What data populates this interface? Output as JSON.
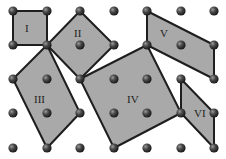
{
  "diagram": {
    "grid": {
      "columns": 7,
      "rows": 5,
      "col_x": [
        13,
        47,
        80,
        114,
        147,
        181,
        214
      ],
      "row_y": [
        11,
        45,
        79,
        113,
        148
      ]
    },
    "colors": {
      "fill": "#a9a9a9",
      "stroke": "#1e1e1e",
      "dot": "#3a3a3a",
      "background": "#ffffff"
    },
    "polygons": [
      {
        "label": "I",
        "vertices": [
          [
            0,
            0
          ],
          [
            1,
            0
          ],
          [
            1,
            1
          ],
          [
            0,
            1
          ]
        ],
        "label_pos": [
          25,
          32
        ]
      },
      {
        "label": "II",
        "vertices": [
          [
            1,
            1
          ],
          [
            2,
            0
          ],
          [
            3,
            1
          ],
          [
            2,
            2
          ]
        ],
        "label_pos": [
          74,
          37
        ]
      },
      {
        "label": "III",
        "vertices": [
          [
            1,
            1
          ],
          [
            0,
            2
          ],
          [
            1,
            4
          ],
          [
            2,
            3
          ]
        ],
        "label_pos": [
          34,
          103
        ]
      },
      {
        "label": "IV",
        "vertices": [
          [
            2,
            2
          ],
          [
            4,
            1
          ],
          [
            5,
            3
          ],
          [
            3,
            4
          ]
        ],
        "label_pos": [
          127,
          103
        ]
      },
      {
        "label": "V",
        "vertices": [
          [
            4,
            0
          ],
          [
            6,
            1
          ],
          [
            6,
            2
          ],
          [
            4,
            1
          ]
        ],
        "label_pos": [
          160,
          37
        ]
      },
      {
        "label": "VI",
        "vertices": [
          [
            5,
            2
          ],
          [
            6,
            3
          ],
          [
            6,
            4
          ],
          [
            5,
            3
          ]
        ],
        "label_pos": [
          194,
          117
        ]
      }
    ]
  }
}
